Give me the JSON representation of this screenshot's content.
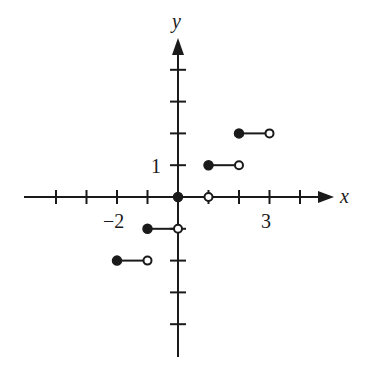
{
  "chart_data": {
    "type": "line",
    "title": "",
    "xlabel": "x",
    "ylabel": "y",
    "xlim": [
      -4,
      5
    ],
    "ylim": [
      -5,
      4
    ],
    "grid": false,
    "x_tick_labels": [
      {
        "value": -2,
        "label": "−2"
      },
      {
        "value": 3,
        "label": "3"
      }
    ],
    "y_tick_labels": [
      {
        "value": 1,
        "label": "1"
      }
    ],
    "x_ticks": [
      -4,
      -3,
      -2,
      -1,
      1,
      2,
      3,
      4
    ],
    "y_ticks": [
      -4,
      -3,
      -2,
      -1,
      1,
      2,
      3,
      4
    ],
    "segments": [
      {
        "x_start": -2,
        "x_end": -1,
        "y": -2,
        "start": "closed",
        "end": "open"
      },
      {
        "x_start": -1,
        "x_end": 0,
        "y": -1,
        "start": "closed",
        "end": "open"
      },
      {
        "x_start": 0,
        "x_end": 1,
        "y": 0,
        "start": "closed",
        "end": "open"
      },
      {
        "x_start": 1,
        "x_end": 2,
        "y": 1,
        "start": "closed",
        "end": "open"
      },
      {
        "x_start": 2,
        "x_end": 3,
        "y": 2,
        "start": "closed",
        "end": "open"
      }
    ]
  },
  "labels": {
    "x_axis": "x",
    "y_axis": "y",
    "tick_x_neg2": "−2",
    "tick_x_3": "3",
    "tick_y_1": "1"
  },
  "colors": {
    "ink": "#1a1a1a",
    "background": "#ffffff"
  }
}
